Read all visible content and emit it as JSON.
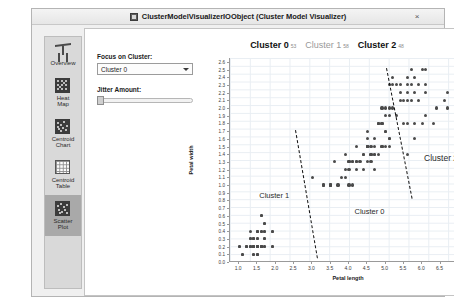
{
  "window": {
    "title": "ClusterModelVisualizerIOObject (Cluster Model Visualizer)",
    "close_label": "×",
    "icon": "window-app-icon"
  },
  "sidebar": {
    "items": [
      {
        "label": "Overview",
        "icon": "overview-icon",
        "selected": false
      },
      {
        "label": "Heat\nMap",
        "icon": "heat-map-icon",
        "selected": false
      },
      {
        "label": "Centroid\nChart",
        "icon": "centroid-chart-icon",
        "selected": false
      },
      {
        "label": "Centroid\nTable",
        "icon": "centroid-table-icon",
        "selected": false
      },
      {
        "label": "Scatter\nPlot",
        "icon": "scatter-plot-icon",
        "selected": true
      }
    ]
  },
  "controls": {
    "focus_label": "Focus on Cluster:",
    "focus_value": "Cluster 0",
    "focus_options": [
      "Cluster 0",
      "Cluster 1",
      "Cluster 2"
    ],
    "jitter_label": "Jitter Amount:",
    "jitter_value": 0,
    "dropdown_icon": "chevron-down-icon"
  },
  "cluster_tabs": [
    {
      "name": "Cluster 0",
      "count": "53",
      "active": true
    },
    {
      "name": "Cluster 1",
      "count": "58",
      "active": false
    },
    {
      "name": "Cluster 2",
      "count": "48",
      "active": true
    }
  ],
  "chart_data": {
    "type": "scatter",
    "title": "",
    "xlabel": "Petal length",
    "ylabel": "Petal width",
    "xlim": [
      0.75,
      7.25
    ],
    "ylim": [
      0.0,
      2.65
    ],
    "xticks": [
      1.0,
      1.5,
      2.0,
      2.5,
      3.0,
      3.5,
      4.0,
      4.5,
      5.0,
      5.5,
      6.0,
      6.5,
      7.0
    ],
    "yticks": [
      0.0,
      0.1,
      0.2,
      0.3,
      0.4,
      0.5,
      0.6,
      0.7,
      0.8,
      0.9,
      1.0,
      1.1,
      1.2,
      1.3,
      1.4,
      1.5,
      1.6,
      1.7,
      1.8,
      1.9,
      2.0,
      2.1,
      2.2,
      2.3,
      2.4,
      2.5,
      2.6
    ],
    "grid": true,
    "legend_position": "in-plot-annotations",
    "point_color": "#4a4a4a",
    "annotations": [
      {
        "text": "Cluster 1",
        "x": 1.55,
        "y": 0.92,
        "size": "normal"
      },
      {
        "text": "Cluster 0",
        "x": 4.15,
        "y": 0.72,
        "size": "normal"
      },
      {
        "text": "Cluster 2",
        "x": 6.05,
        "y": 1.42,
        "size": "big"
      }
    ],
    "boundaries": [
      {
        "name": "boundary-cluster1-cluster0",
        "x1": 2.55,
        "y1": 1.72,
        "x2": 3.15,
        "y2": 0.05
      },
      {
        "name": "boundary-cluster0-cluster2",
        "x1": 5.05,
        "y1": 2.52,
        "x2": 5.75,
        "y2": 0.82
      }
    ],
    "series": [
      {
        "name": "Cluster 1",
        "points": [
          [
            1.0,
            0.2
          ],
          [
            1.1,
            0.1
          ],
          [
            1.2,
            0.2
          ],
          [
            1.3,
            0.2
          ],
          [
            1.3,
            0.3
          ],
          [
            1.3,
            0.4
          ],
          [
            1.4,
            0.1
          ],
          [
            1.4,
            0.2
          ],
          [
            1.4,
            0.2
          ],
          [
            1.4,
            0.3
          ],
          [
            1.4,
            0.3
          ],
          [
            1.5,
            0.1
          ],
          [
            1.5,
            0.2
          ],
          [
            1.5,
            0.2
          ],
          [
            1.5,
            0.2
          ],
          [
            1.5,
            0.3
          ],
          [
            1.5,
            0.4
          ],
          [
            1.5,
            0.4
          ],
          [
            1.6,
            0.2
          ],
          [
            1.6,
            0.2
          ],
          [
            1.6,
            0.4
          ],
          [
            1.6,
            0.6
          ],
          [
            1.7,
            0.2
          ],
          [
            1.7,
            0.3
          ],
          [
            1.7,
            0.4
          ],
          [
            1.7,
            0.5
          ],
          [
            1.9,
            0.2
          ],
          [
            1.9,
            0.4
          ],
          [
            1.5,
            0.2
          ],
          [
            1.4,
            0.2
          ],
          [
            1.6,
            0.2
          ],
          [
            1.5,
            0.1
          ],
          [
            1.2,
            0.2
          ],
          [
            1.3,
            0.2
          ],
          [
            1.4,
            0.2
          ],
          [
            1.5,
            0.2
          ],
          [
            1.6,
            0.2
          ],
          [
            1.4,
            0.3
          ],
          [
            1.5,
            0.3
          ],
          [
            1.7,
            0.3
          ],
          [
            1.3,
            0.3
          ],
          [
            1.5,
            0.4
          ],
          [
            1.6,
            0.4
          ],
          [
            1.7,
            0.4
          ],
          [
            1.9,
            0.4
          ],
          [
            1.7,
            0.5
          ],
          [
            1.6,
            0.6
          ],
          [
            1.4,
            0.1
          ],
          [
            1.5,
            0.1
          ],
          [
            1.1,
            0.1
          ],
          [
            1.0,
            0.2
          ],
          [
            1.2,
            0.2
          ],
          [
            1.3,
            0.2
          ],
          [
            1.4,
            0.2
          ],
          [
            1.5,
            0.2
          ],
          [
            1.6,
            0.2
          ],
          [
            1.7,
            0.2
          ],
          [
            1.9,
            0.2
          ]
        ]
      },
      {
        "name": "Cluster 0",
        "points": [
          [
            3.0,
            1.1
          ],
          [
            3.3,
            1.0
          ],
          [
            3.3,
            1.0
          ],
          [
            3.5,
            1.0
          ],
          [
            3.5,
            1.0
          ],
          [
            3.6,
            1.3
          ],
          [
            3.7,
            1.0
          ],
          [
            3.8,
            1.1
          ],
          [
            3.9,
            1.2
          ],
          [
            3.9,
            1.4
          ],
          [
            4.0,
            1.0
          ],
          [
            4.0,
            1.3
          ],
          [
            4.0,
            1.3
          ],
          [
            4.1,
            1.0
          ],
          [
            4.1,
            1.3
          ],
          [
            4.1,
            1.3
          ],
          [
            4.2,
            1.2
          ],
          [
            4.2,
            1.3
          ],
          [
            4.2,
            1.3
          ],
          [
            4.2,
            1.5
          ],
          [
            4.3,
            1.3
          ],
          [
            4.4,
            1.2
          ],
          [
            4.4,
            1.4
          ],
          [
            4.4,
            1.4
          ],
          [
            4.5,
            1.3
          ],
          [
            4.5,
            1.5
          ],
          [
            4.5,
            1.5
          ],
          [
            4.5,
            1.5
          ],
          [
            4.5,
            1.6
          ],
          [
            4.6,
            1.3
          ],
          [
            4.6,
            1.4
          ],
          [
            4.6,
            1.4
          ],
          [
            4.6,
            1.5
          ],
          [
            4.7,
            1.2
          ],
          [
            4.7,
            1.4
          ],
          [
            4.7,
            1.4
          ],
          [
            4.7,
            1.6
          ],
          [
            4.8,
            1.4
          ],
          [
            4.8,
            1.8
          ],
          [
            4.8,
            1.8
          ],
          [
            4.9,
            1.5
          ],
          [
            4.9,
            1.5
          ],
          [
            4.9,
            1.8
          ],
          [
            5.0,
            1.7
          ],
          [
            5.0,
            1.9
          ],
          [
            5.1,
            1.6
          ],
          [
            3.9,
            1.1
          ],
          [
            4.5,
            1.5
          ],
          [
            4.0,
            1.2
          ],
          [
            4.7,
            1.5
          ],
          [
            4.9,
            2.0
          ],
          [
            4.5,
            1.7
          ],
          [
            3.5,
            1.0
          ]
        ]
      },
      {
        "name": "Cluster 2",
        "points": [
          [
            4.5,
            1.5
          ],
          [
            4.8,
            1.8
          ],
          [
            4.9,
            1.8
          ],
          [
            5.0,
            1.5
          ],
          [
            5.0,
            1.7
          ],
          [
            5.1,
            1.5
          ],
          [
            5.1,
            1.6
          ],
          [
            5.1,
            1.9
          ],
          [
            5.1,
            2.0
          ],
          [
            5.1,
            2.3
          ],
          [
            5.2,
            2.0
          ],
          [
            5.2,
            2.3
          ],
          [
            5.3,
            1.9
          ],
          [
            5.3,
            2.3
          ],
          [
            5.4,
            2.1
          ],
          [
            5.4,
            2.3
          ],
          [
            5.5,
            1.8
          ],
          [
            5.5,
            2.1
          ],
          [
            5.6,
            1.4
          ],
          [
            5.6,
            1.8
          ],
          [
            5.6,
            2.1
          ],
          [
            5.6,
            2.2
          ],
          [
            5.6,
            2.4
          ],
          [
            5.7,
            2.1
          ],
          [
            5.7,
            2.3
          ],
          [
            5.7,
            2.5
          ],
          [
            5.8,
            1.6
          ],
          [
            5.8,
            1.8
          ],
          [
            5.8,
            2.2
          ],
          [
            5.9,
            2.1
          ],
          [
            5.9,
            2.3
          ],
          [
            6.0,
            1.8
          ],
          [
            6.0,
            2.5
          ],
          [
            6.1,
            1.9
          ],
          [
            6.1,
            2.3
          ],
          [
            6.1,
            2.5
          ],
          [
            6.3,
            1.8
          ],
          [
            6.4,
            2.0
          ],
          [
            6.6,
            2.1
          ],
          [
            6.7,
            2.0
          ],
          [
            6.7,
            2.2
          ],
          [
            6.9,
            2.3
          ],
          [
            5.0,
            2.0
          ],
          [
            5.2,
            2.4
          ],
          [
            5.4,
            2.2
          ],
          [
            5.6,
            2.3
          ],
          [
            5.8,
            2.4
          ],
          [
            6.1,
            2.2
          ]
        ]
      }
    ]
  }
}
